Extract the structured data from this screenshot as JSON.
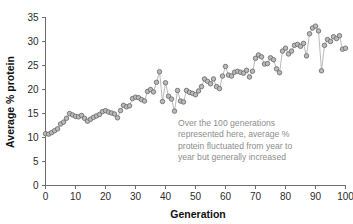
{
  "chart_data": {
    "type": "line",
    "title": "",
    "xlabel": "Generation",
    "ylabel": "Average % protein",
    "xlim": [
      0,
      100
    ],
    "ylim": [
      0,
      35
    ],
    "grid": false,
    "legend": "none",
    "marker": "circle",
    "xticks": [
      0,
      10,
      20,
      30,
      40,
      50,
      60,
      70,
      80,
      90,
      100
    ],
    "xtick_labels": [
      "0",
      "10",
      "20",
      "30",
      "40",
      "50",
      "60",
      "70",
      "80",
      "90",
      "100"
    ],
    "yticks": [
      0,
      5,
      10,
      15,
      20,
      25,
      30,
      35
    ],
    "ytick_labels": [
      "0",
      "5",
      "10",
      "15",
      "20",
      "25",
      "30",
      "35"
    ],
    "series": [
      {
        "name": "Average % protein",
        "marker_fill": "#b9b9b9",
        "marker_stroke": "#6b6b6b",
        "line_color": "#adadad",
        "x": [
          0,
          1,
          2,
          3,
          4,
          5,
          6,
          7,
          8,
          9,
          10,
          11,
          12,
          13,
          14,
          15,
          16,
          17,
          18,
          19,
          20,
          21,
          22,
          23,
          24,
          25,
          26,
          27,
          28,
          29,
          30,
          31,
          32,
          33,
          34,
          35,
          36,
          37,
          38,
          39,
          40,
          41,
          42,
          43,
          44,
          45,
          46,
          47,
          48,
          49,
          50,
          51,
          52,
          53,
          54,
          55,
          56,
          57,
          58,
          59,
          60,
          61,
          62,
          63,
          64,
          65,
          66,
          67,
          68,
          69,
          70,
          71,
          72,
          73,
          74,
          75,
          76,
          77,
          78,
          79,
          80,
          81,
          82,
          83,
          84,
          85,
          86,
          87,
          88,
          89,
          90,
          91,
          92,
          93,
          94,
          95,
          96,
          97,
          98,
          99,
          100
        ],
        "values": [
          10.8,
          10.7,
          11.0,
          11.4,
          11.8,
          12.8,
          13.2,
          14.0,
          15.0,
          14.7,
          14.4,
          14.3,
          14.6,
          14.0,
          13.4,
          13.8,
          14.2,
          14.5,
          14.8,
          15.4,
          15.6,
          15.3,
          15.1,
          14.9,
          14.1,
          15.6,
          16.7,
          16.4,
          16.6,
          18.1,
          18.4,
          18.3,
          17.9,
          17.6,
          19.6,
          20.0,
          19.5,
          21.5,
          23.7,
          17.5,
          21.4,
          18.6,
          18.0,
          15.5,
          19.8,
          17.6,
          17.4,
          19.8,
          19.4,
          19.2,
          18.9,
          19.7,
          20.6,
          22.2,
          21.7,
          21.2,
          22.2,
          20.6,
          20.2,
          22.8,
          24.8,
          23.0,
          22.8,
          23.6,
          23.8,
          23.6,
          23.4,
          24.0,
          22.6,
          23.8,
          26.5,
          27.2,
          26.8,
          25.3,
          25.4,
          26.6,
          26.2,
          24.3,
          23.5,
          28.0,
          28.6,
          27.4,
          28.0,
          29.2,
          29.4,
          29.0,
          29.6,
          27.0,
          31.6,
          32.8,
          33.2,
          32.2,
          23.9,
          29.2,
          30.4,
          30.0,
          31.0,
          30.6,
          31.2,
          28.4,
          28.6
        ]
      }
    ],
    "annotations": [
      {
        "name": "trend-callout",
        "text_lines": [
          "Over the 100 generations",
          "represented here, average %",
          "protein fluctuated from year to",
          "year but generally increased"
        ],
        "color": "#8d8d8d"
      }
    ]
  }
}
